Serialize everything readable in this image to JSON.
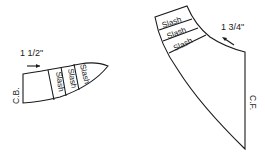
{
  "diagram": {
    "left_piece": {
      "measure_label": "1 1/2\"",
      "edge_label": "C.B.",
      "slash_labels": [
        "Slash",
        "Slash",
        "Slash"
      ],
      "arrow_direction": "right"
    },
    "right_piece": {
      "measure_label": "1 3/4\"",
      "edge_label": "C.F.",
      "slash_labels": [
        "Slash",
        "Slash",
        "Slash"
      ],
      "arrow_direction": "left"
    },
    "colors": {
      "stroke": "#1a1a1a",
      "background": "#ffffff"
    }
  }
}
